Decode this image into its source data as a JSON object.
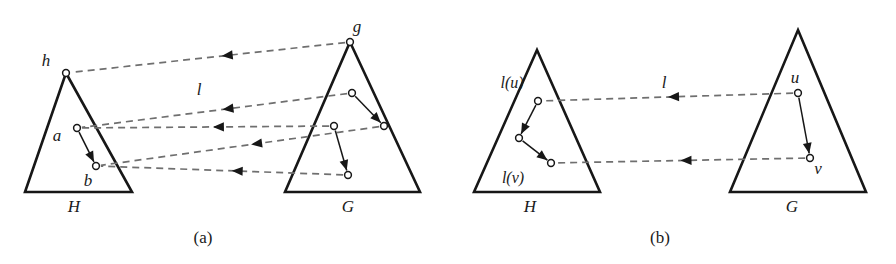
{
  "figure": {
    "background_color": "#ffffff",
    "ink_color": "#171717",
    "dashed_color": "#6f6f6f",
    "width": 896,
    "height": 264
  },
  "panels": [
    {
      "id": "panel-a",
      "caption": "(a)",
      "caption_pos": {
        "x": 203,
        "y": 243
      },
      "triangles": [
        {
          "name": "H",
          "label": "H",
          "label_pos": {
            "x": 74,
            "y": 212
          },
          "apex": {
            "x": 66,
            "y": 73
          },
          "base_left": {
            "x": 25,
            "y": 192
          },
          "base_right": {
            "x": 132,
            "y": 192
          }
        },
        {
          "name": "G",
          "label": "G",
          "label_pos": {
            "x": 348,
            "y": 212
          },
          "apex": {
            "x": 350,
            "y": 42
          },
          "base_left": {
            "x": 285,
            "y": 192
          },
          "base_right": {
            "x": 420,
            "y": 192
          }
        }
      ],
      "nodes": [
        {
          "id": "h",
          "label": "h",
          "x": 66,
          "y": 73,
          "r": 3.4,
          "label_pos": {
            "x": 46,
            "y": 66
          }
        },
        {
          "id": "a",
          "label": "a",
          "x": 77,
          "y": 128,
          "r": 3.4,
          "label_pos": {
            "x": 57,
            "y": 141
          }
        },
        {
          "id": "b",
          "label": "b",
          "x": 96,
          "y": 166,
          "r": 3.4,
          "label_pos": {
            "x": 88,
            "y": 186
          }
        },
        {
          "id": "g",
          "label": "g",
          "x": 350,
          "y": 42,
          "r": 3.4,
          "label_pos": {
            "x": 357,
            "y": 32
          }
        },
        {
          "id": "g1-top",
          "label": "",
          "x": 352,
          "y": 93,
          "r": 3.4,
          "label_pos": null
        },
        {
          "id": "g1-bot",
          "label": "",
          "x": 384,
          "y": 126,
          "r": 3.4,
          "label_pos": null
        },
        {
          "id": "g2-top",
          "label": "",
          "x": 334,
          "y": 126,
          "r": 3.4,
          "label_pos": null
        },
        {
          "id": "g2-bot",
          "label": "",
          "x": 348,
          "y": 175,
          "r": 3.4,
          "label_pos": null
        }
      ],
      "solid_edges": [
        {
          "from": "a",
          "to": "b",
          "arrow": "to"
        },
        {
          "from": "g1-top",
          "to": "g1-bot",
          "arrow": "to"
        },
        {
          "from": "g2-top",
          "to": "g2-bot",
          "arrow": "to"
        }
      ],
      "dashed_edges": [
        {
          "from": "g",
          "to": "h",
          "arrow_at": 0.45,
          "name": "map-g-to-h"
        },
        {
          "from": "g1-top",
          "to": "a",
          "arrow_at": 0.47,
          "name": "map-g1top-to-a"
        },
        {
          "from": "g2-top",
          "to": "a",
          "arrow_at": 0.47,
          "name": "map-g2top-to-a"
        },
        {
          "from": "g1-bot",
          "to": "b",
          "arrow_at": 0.46,
          "name": "map-g1bot-to-b"
        },
        {
          "from": "g2-bot",
          "to": "b",
          "arrow_at": 0.46,
          "name": "map-g2bot-to-b"
        }
      ],
      "map_label": {
        "text": "l",
        "x": 199,
        "y": 95
      }
    },
    {
      "id": "panel-b",
      "caption": "(b)",
      "caption_pos": {
        "x": 660,
        "y": 243
      },
      "triangles": [
        {
          "name": "H",
          "label": "H",
          "label_pos": {
            "x": 530,
            "y": 212
          },
          "apex": {
            "x": 537,
            "y": 50
          },
          "base_left": {
            "x": 474,
            "y": 192
          },
          "base_right": {
            "x": 600,
            "y": 192
          }
        },
        {
          "name": "G",
          "label": "G",
          "label_pos": {
            "x": 792,
            "y": 212
          },
          "apex": {
            "x": 798,
            "y": 30
          },
          "base_left": {
            "x": 730,
            "y": 192
          },
          "base_right": {
            "x": 866,
            "y": 192
          }
        }
      ],
      "nodes": [
        {
          "id": "lu",
          "label": "l(u)",
          "x": 538,
          "y": 101,
          "r": 3.4,
          "label_pos": {
            "x": 512,
            "y": 88
          }
        },
        {
          "id": "mid",
          "label": "",
          "x": 519,
          "y": 138,
          "r": 3.4,
          "label_pos": null
        },
        {
          "id": "lv",
          "label": "l(v)",
          "x": 551,
          "y": 163,
          "r": 3.4,
          "label_pos": {
            "x": 513,
            "y": 183
          }
        },
        {
          "id": "u",
          "label": "u",
          "x": 798,
          "y": 93,
          "r": 3.4,
          "label_pos": {
            "x": 795,
            "y": 83
          }
        },
        {
          "id": "v",
          "label": "v",
          "x": 810,
          "y": 158,
          "r": 3.4,
          "label_pos": {
            "x": 818,
            "y": 174
          }
        }
      ],
      "solid_edges": [
        {
          "from": "lu",
          "to": "mid",
          "arrow": "to"
        },
        {
          "from": "mid",
          "to": "lv",
          "arrow": "to"
        },
        {
          "from": "u",
          "to": "v",
          "arrow": "to"
        }
      ],
      "dashed_edges": [
        {
          "from": "u",
          "to": "lu",
          "arrow_at": 0.5,
          "name": "map-u-to-lu"
        },
        {
          "from": "v",
          "to": "lv",
          "arrow_at": 0.5,
          "name": "map-v-to-lv"
        }
      ],
      "map_label": {
        "text": "l",
        "x": 664,
        "y": 88
      }
    }
  ]
}
